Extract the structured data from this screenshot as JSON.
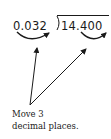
{
  "division": {
    "divisor": "0.032",
    "dividend": "14.400",
    "bracket": ")"
  },
  "annotation": {
    "line1": "Move 3",
    "line2": "decimal places."
  },
  "colors": {
    "ink": "#1a1a1a",
    "background": "#ffffff"
  }
}
